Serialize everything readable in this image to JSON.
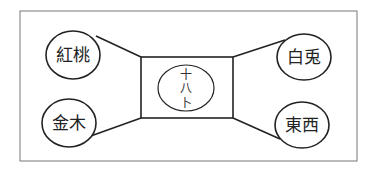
{
  "diagram": {
    "center": {
      "label_lines": [
        "十",
        "八",
        "卜"
      ]
    },
    "nodes": {
      "top_left": "紅桃",
      "bottom_left": "金木",
      "top_right": "白兎",
      "bottom_right": "東西"
    }
  }
}
